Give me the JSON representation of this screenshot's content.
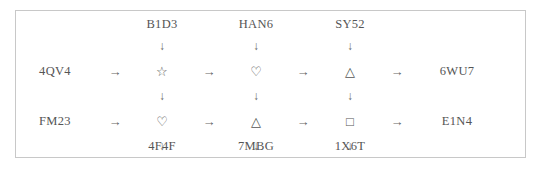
{
  "diagram": {
    "type": "symbol-flow-grid",
    "rows": 2,
    "columns": 3,
    "border_color": "#c8c8c8",
    "text_color": "#555555",
    "column_inputs": [
      "B1D3",
      "HAN6",
      "SY52"
    ],
    "column_outputs": [
      "4F4F",
      "7MBG",
      "1X6T"
    ],
    "row_inputs": [
      "4QV4",
      "FM23"
    ],
    "row_outputs": [
      "6WU7",
      "E1N4"
    ],
    "symbols": [
      [
        "star",
        "heart",
        "triangle"
      ],
      [
        "heart",
        "triangle",
        "square"
      ]
    ],
    "glyphs": {
      "star": "☆",
      "heart": "♡",
      "triangle": "△",
      "square": "□",
      "arrow_right": "→",
      "arrow_down": "↓"
    },
    "cells": {
      "r0c0": "☆",
      "r0c1": "♡",
      "r0c2": "△",
      "r1c0": "♡",
      "r1c1": "△",
      "r1c2": "□"
    },
    "arrows": {
      "right": "→",
      "down": "↓"
    }
  }
}
